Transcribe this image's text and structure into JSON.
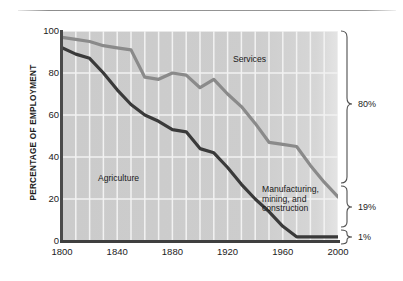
{
  "chart_data": {
    "type": "area",
    "title": "",
    "xlabel": "",
    "ylabel": "PERCENTAGE OF EMPLOYMENT",
    "xlim": [
      1800,
      2000
    ],
    "ylim": [
      0,
      100
    ],
    "grid": true,
    "grid_spacing_years": 10,
    "x_ticks": [
      1800,
      1840,
      1880,
      1920,
      1960,
      2000
    ],
    "y_ticks": [
      0,
      20,
      40,
      60,
      80,
      100
    ],
    "legend_position": "inline-annotations",
    "bands": [
      {
        "name": "Services",
        "label": "Services",
        "end_value_label": "80%",
        "description": "Region above the upper gray boundary line"
      },
      {
        "name": "Manufacturing, mining, and construction",
        "label": "Manufacturing,\nmining, and\nconstruction",
        "end_value_label": "19%",
        "description": "Region between the dark lower line and the gray upper line"
      },
      {
        "name": "Agriculture",
        "label": "Agriculture",
        "end_value_label": "1%",
        "description": "Region below the dark lower boundary line"
      }
    ],
    "series": [
      {
        "name": "upper-boundary-gray",
        "display_name": "Agriculture + manufacturing, mining and construction (cumulative)",
        "color": "#8a8a8a",
        "x": [
          1800,
          1810,
          1820,
          1830,
          1840,
          1850,
          1860,
          1870,
          1880,
          1890,
          1900,
          1910,
          1920,
          1930,
          1940,
          1950,
          1960,
          1970,
          1980,
          1990,
          2000
        ],
        "values": [
          97,
          96,
          95,
          93,
          92,
          91,
          78,
          77,
          80,
          79,
          73,
          77,
          70,
          64,
          56,
          47,
          46,
          45,
          36,
          28,
          21
        ]
      },
      {
        "name": "lower-boundary-dark",
        "display_name": "Agriculture (cumulative)",
        "color": "#3a3a3a",
        "x": [
          1800,
          1810,
          1820,
          1830,
          1840,
          1850,
          1860,
          1870,
          1880,
          1890,
          1900,
          1910,
          1920,
          1930,
          1940,
          1950,
          1960,
          1970,
          1980,
          1990,
          2000
        ],
        "values": [
          92,
          89,
          87,
          80,
          72,
          65,
          60,
          57,
          53,
          52,
          44,
          42,
          35,
          27,
          20,
          14,
          7,
          2,
          2,
          2,
          2
        ]
      }
    ],
    "annotations": [
      {
        "text": "Services",
        "x": 1915,
        "y": 87
      },
      {
        "text": "Agriculture",
        "x": 1852,
        "y": 28
      },
      {
        "text": "Manufacturing,\nmining, and\nconstruction",
        "x": 1955,
        "y": 19
      }
    ],
    "right_axis_brackets": [
      {
        "label": "80%",
        "from": 21,
        "to": 100
      },
      {
        "label": "19%",
        "from": 2,
        "to": 21
      },
      {
        "label": "1%",
        "from": 0,
        "to": 2
      }
    ]
  },
  "colors": {
    "plot_background": "#cfcfcf",
    "gridline": "#f2f2f2",
    "axis": "#4a4a4a",
    "upper_line": "#8a8a8a",
    "lower_line": "#3a3a3a",
    "text": "#1d1d1d",
    "page_background": "#ffffff"
  }
}
